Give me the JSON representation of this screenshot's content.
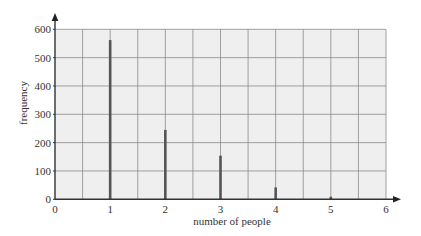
{
  "chart_data": {
    "type": "bar",
    "title": "",
    "xlabel": "number of people",
    "ylabel": "frequency",
    "categories": [
      "1",
      "2",
      "3",
      "4",
      "5"
    ],
    "x": [
      1,
      2,
      3,
      4,
      5
    ],
    "values": [
      562,
      245,
      154,
      42,
      9
    ],
    "xlim": [
      0,
      6
    ],
    "ylim": [
      0,
      600
    ],
    "x_ticks": [
      "0",
      "1",
      "2",
      "3",
      "4",
      "5",
      "6"
    ],
    "y_ticks": [
      "0",
      "100",
      "200",
      "300",
      "400",
      "500",
      "600"
    ],
    "grid": true,
    "grid_minor_x": 0.5,
    "legend": null,
    "bar_style": "thin vertical lines"
  },
  "colors": {
    "plot_background": "#efefef",
    "grid": "#8a8a8a",
    "axis": "#333333",
    "bar": "#555555"
  }
}
